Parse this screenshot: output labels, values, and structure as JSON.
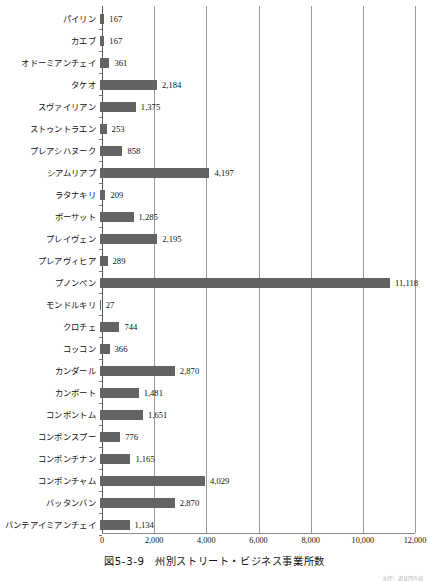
{
  "caption": "図5-3-9　州別ストリート・ビジネス事業所数",
  "source_note": "出所：調査団作成",
  "colors": {
    "bar": "#636363",
    "gridline": "#9a9a9a",
    "axis": "#555555",
    "text": "#111111"
  },
  "chart_data": {
    "type": "bar",
    "orientation": "horizontal",
    "title": "図5-3-9　州別ストリート・ビジネス事業所数",
    "xlabel": "",
    "ylabel": "",
    "xlim": [
      0,
      12000
    ],
    "grid": true,
    "legend": false,
    "xticks": [
      0,
      2000,
      4000,
      6000,
      8000,
      10000,
      12000
    ],
    "xticklabels": [
      "0",
      "2,000",
      "4,000",
      "6,000",
      "8,000",
      "10,000",
      "12,000"
    ],
    "categories": [
      "パイリン",
      "カエブ",
      "オドーミアンチェイ",
      "タケオ",
      "スヴァイリアン",
      "ストゥントラエン",
      "プレアシハヌーク",
      "シアムリアプ",
      "ラタナキリ",
      "ポーサット",
      "プレイヴェン",
      "プレアヴィヒア",
      "プノンペン",
      "モンドルキリ",
      "クロチェ",
      "コッコン",
      "カンダール",
      "カンポート",
      "コンポントム",
      "コンポンスプー",
      "コンポンチナン",
      "コンポンチャム",
      "バッタンバン",
      "バンテアイミアンチェイ"
    ],
    "values": [
      167,
      167,
      361,
      2184,
      1375,
      253,
      858,
      4197,
      209,
      1285,
      2195,
      289,
      11118,
      27,
      744,
      366,
      2870,
      1481,
      1651,
      776,
      1165,
      4029,
      2870,
      1134
    ],
    "value_labels": [
      "167",
      "167",
      "361",
      "2,184",
      "1,375",
      "253",
      "858",
      "4,197",
      "209",
      "1,285",
      "2,195",
      "289",
      "11,118",
      "27",
      "744",
      "366",
      "2,870",
      "1,481",
      "1,651",
      "776",
      "1,165",
      "4,029",
      "2,870",
      "1,134"
    ]
  }
}
